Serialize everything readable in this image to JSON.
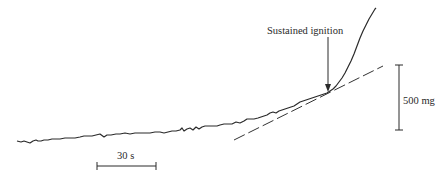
{
  "figure": {
    "annotations": {
      "ignition_label": "Sustained ignition",
      "time_scale_label": "30 s",
      "mass_scale_label": "500 mg"
    },
    "colors": {
      "trace": "#2b2b2b",
      "tangent": "#333333",
      "background": "#ffffff"
    },
    "trace_description": "Mass-loss trace rising slowly then sharply after sustained ignition",
    "tangent_line": "dashed"
  }
}
